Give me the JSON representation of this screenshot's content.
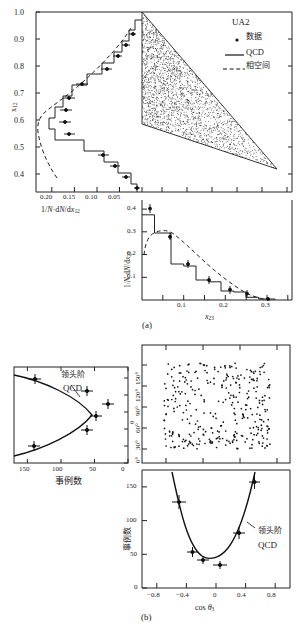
{
  "figure": {
    "caption_a": "(a)",
    "caption_b": "(b)"
  },
  "legend": {
    "experiment": "UA2",
    "items": [
      {
        "marker": "point-marker",
        "label": "数据"
      },
      {
        "marker": "solid-line",
        "label": "QCD"
      },
      {
        "marker": "dashed-line",
        "label": "相空间"
      }
    ]
  },
  "annotations": {
    "lo_qcd_left": "领头阶\nQCD",
    "lo_qcd_left_line1": "领头阶",
    "lo_qcd_left_line2": "QCD",
    "lo_qcd_bottom_line1": "领头阶",
    "lo_qcd_bottom_line2": "QCD"
  },
  "chart_data": [
    {
      "id": "x12-projection",
      "type": "bar",
      "title": "",
      "xlabel": "1/N·dN/dx12",
      "ylabel": "x12",
      "orientation": "horizontal-reversed-x",
      "xlim": [
        0.235,
        0.0
      ],
      "ylim": [
        0.333,
        1.0
      ],
      "xticks": [
        0.2,
        0.15,
        0.1,
        0.05
      ],
      "xtick_labels": [
        "0.20",
        "0.15",
        "0.10",
        "0.05"
      ],
      "yticks": [
        0.4,
        0.5,
        0.6,
        0.7,
        0.8,
        0.9,
        1.0
      ],
      "ytick_labels": [
        "0.4",
        "0.5",
        "0.6",
        "0.7",
        "0.8",
        "0.9",
        "1.0"
      ],
      "grid": false,
      "series": [
        {
          "name": "QCD",
          "style": "step-histogram",
          "bins_y": [
            0.35,
            0.39,
            0.43,
            0.47,
            0.51,
            0.55,
            0.59,
            0.63,
            0.67,
            0.71,
            0.75,
            0.79,
            0.83,
            0.87
          ],
          "values": [
            0.012,
            0.028,
            0.055,
            0.085,
            0.12,
            0.19,
            0.205,
            0.175,
            0.14,
            0.105,
            0.075,
            0.048,
            0.028,
            0.01
          ]
        },
        {
          "name": "相空间",
          "style": "dashed-curve",
          "bins_y": [
            0.35,
            0.39,
            0.43,
            0.47,
            0.51,
            0.55,
            0.59,
            0.63,
            0.67,
            0.71,
            0.75,
            0.79,
            0.83,
            0.87
          ],
          "values": [
            0.006,
            0.018,
            0.04,
            0.075,
            0.125,
            0.19,
            0.18,
            0.145,
            0.115,
            0.088,
            0.065,
            0.042,
            0.024,
            0.01
          ]
        },
        {
          "name": "数据",
          "style": "points-with-errors",
          "points": [
            {
              "y": 0.355,
              "x": 0.008,
              "xerr": 0.006
            },
            {
              "y": 0.395,
              "x": 0.03,
              "xerr": 0.008
            },
            {
              "y": 0.43,
              "x": 0.052,
              "xerr": 0.01
            },
            {
              "y": 0.47,
              "x": 0.078,
              "xerr": 0.011
            },
            {
              "y": 0.52,
              "x": 0.148,
              "xerr": 0.012
            },
            {
              "y": 0.572,
              "x": 0.16,
              "xerr": 0.012
            },
            {
              "y": 0.62,
              "x": 0.155,
              "xerr": 0.013
            },
            {
              "y": 0.672,
              "x": 0.148,
              "xerr": 0.012
            },
            {
              "y": 0.722,
              "x": 0.12,
              "xerr": 0.012
            },
            {
              "y": 0.765,
              "x": 0.063,
              "xerr": 0.01
            },
            {
              "y": 0.815,
              "x": 0.04,
              "xerr": 0.008
            },
            {
              "y": 0.855,
              "x": 0.022,
              "xerr": 0.007
            },
            {
              "y": 0.885,
              "x": 0.012,
              "xerr": 0.006
            }
          ]
        }
      ]
    },
    {
      "id": "dalitz-scatter",
      "type": "scatter",
      "title": "UA2 three-jet Dalitz plot",
      "xlabel": "x23",
      "ylabel": "x12",
      "xlim": [
        0.0,
        0.36
      ],
      "ylim": [
        0.333,
        1.0
      ],
      "boundary": "triangle",
      "n_points_approx": 2600,
      "grid": false
    },
    {
      "id": "x23-projection",
      "type": "bar",
      "title": "",
      "xlabel": "x23",
      "ylabel": "1/N·dN/dx23",
      "xlim": [
        0.0,
        0.36
      ],
      "ylim": [
        0.0,
        0.44
      ],
      "xticks": [
        0.1,
        0.2,
        0.3
      ],
      "xtick_labels": [
        "0.1",
        "0.2",
        "0.3"
      ],
      "yticks": [
        0.1,
        0.2,
        0.3,
        0.4
      ],
      "ytick_labels": [
        "0.1",
        "0.2",
        "0.3",
        "0.4"
      ],
      "grid": false,
      "series": [
        {
          "name": "QCD",
          "style": "step-histogram",
          "bins_x": [
            0.02,
            0.05,
            0.08,
            0.11,
            0.14,
            0.17,
            0.2,
            0.23,
            0.26,
            0.29,
            0.32
          ],
          "values": [
            0.375,
            0.375,
            0.295,
            0.158,
            0.15,
            0.088,
            0.08,
            0.04,
            0.035,
            0.012,
            0.004
          ]
        },
        {
          "name": "相空间",
          "style": "dashed-curve",
          "bins_x": [
            0.02,
            0.05,
            0.08,
            0.11,
            0.14,
            0.17,
            0.2,
            0.23,
            0.26,
            0.29,
            0.32
          ],
          "values": [
            0.17,
            0.272,
            0.276,
            0.248,
            0.218,
            0.188,
            0.155,
            0.12,
            0.082,
            0.042,
            0.004
          ]
        },
        {
          "name": "数据",
          "style": "points-with-errors",
          "points": [
            {
              "x": 0.03,
              "y": 0.405,
              "yerr": 0.02
            },
            {
              "x": 0.08,
              "y": 0.272,
              "yerr": 0.016
            },
            {
              "x": 0.122,
              "y": 0.158,
              "yerr": 0.012
            },
            {
              "x": 0.172,
              "y": 0.088,
              "yerr": 0.01
            },
            {
              "x": 0.222,
              "y": 0.046,
              "yerr": 0.008
            },
            {
              "x": 0.262,
              "y": 0.028,
              "yerr": 0.007
            },
            {
              "x": 0.312,
              "y": 0.005,
              "yerr": 0.004
            }
          ]
        }
      ]
    },
    {
      "id": "psi-projection",
      "type": "line",
      "title": "",
      "xlabel": "事例数",
      "ylabel": "θ",
      "orientation": "horizontal-reversed-x",
      "xlim": [
        170,
        0
      ],
      "ylim": [
        0,
        170
      ],
      "xticks": [
        150,
        100,
        50,
        0
      ],
      "xtick_labels": [
        "150",
        "100",
        "50",
        "0"
      ],
      "yticks": [
        0,
        30,
        60,
        90,
        120,
        150
      ],
      "ytick_labels": [
        "0°",
        "30°",
        "60°",
        "90°",
        "120°",
        "150°"
      ],
      "grid": false,
      "series": [
        {
          "name": "领头阶 QCD",
          "style": "solid-curve",
          "description": "sideways parabola opening left"
        },
        {
          "name": "数据",
          "style": "points-with-errors",
          "points": [
            {
              "y": 22,
              "x": 140,
              "xerr": 13,
              "yerr": 7
            },
            {
              "y": 47,
              "x": 63,
              "xerr": 11,
              "yerr": 8
            },
            {
              "y": 72,
              "x": 48,
              "xerr": 10,
              "yerr": 7
            },
            {
              "y": 95,
              "x": 35,
              "xerr": 10,
              "yerr": 8
            },
            {
              "y": 122,
              "x": 63,
              "xerr": 11,
              "yerr": 8
            },
            {
              "y": 150,
              "x": 143,
              "xerr": 13,
              "yerr": 8
            }
          ]
        }
      ]
    },
    {
      "id": "angular-scatter",
      "type": "scatter",
      "xlabel": "cos θ3",
      "ylabel": "θ",
      "xlim": [
        -1.0,
        1.0
      ],
      "ylim": [
        0,
        170
      ],
      "n_points_approx": 430,
      "grid": false
    },
    {
      "id": "costheta3-distribution",
      "type": "line",
      "title": "",
      "xlabel": "cos θ3",
      "ylabel": "事例数",
      "xlim": [
        -1.0,
        1.0
      ],
      "ylim": [
        0,
        175
      ],
      "xticks": [
        -0.8,
        -0.4,
        0,
        0.4,
        0.8
      ],
      "xtick_labels": [
        "−0.8",
        "−0.4",
        "0",
        "0.4",
        "0.8"
      ],
      "yticks": [
        0,
        50,
        100,
        150
      ],
      "ytick_labels": [
        "0",
        "50",
        "100",
        "150"
      ],
      "grid": false,
      "series": [
        {
          "name": "领头阶 QCD",
          "style": "solid-curve",
          "description": "upward parabola minimum near cos θ3 = −0.05, value ≈ 48"
        },
        {
          "name": "数据",
          "style": "points-with-errors",
          "points": [
            {
              "x": -0.5,
              "y": 128,
              "xerr": 0.09,
              "yerr": 11
            },
            {
              "x": -0.32,
              "y": 54,
              "xerr": 0.07,
              "yerr": 8
            },
            {
              "x": -0.17,
              "y": 42,
              "xerr": 0.08,
              "yerr": 6
            },
            {
              "x": 0.04,
              "y": 34,
              "xerr": 0.09,
              "yerr": 6
            },
            {
              "x": 0.29,
              "y": 81,
              "xerr": 0.08,
              "yerr": 9
            },
            {
              "x": 0.51,
              "y": 157,
              "xerr": 0.07,
              "yerr": 11
            }
          ]
        }
      ]
    }
  ]
}
